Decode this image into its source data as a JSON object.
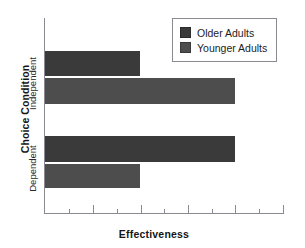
{
  "top_remnant": "",
  "chart_data": {
    "type": "bar",
    "orientation": "horizontal",
    "title": "",
    "xlabel": "Effectiveness",
    "ylabel": "Choice Condition",
    "categories": [
      "Independent",
      "Dependent"
    ],
    "grid": false,
    "xlim": [
      0,
      10
    ],
    "x_tick_labels": [],
    "x_ticks_major": [
      1,
      2,
      3,
      4,
      5,
      6,
      7,
      8
    ],
    "x_ticks_minor": [
      0.5,
      1.5,
      2.5,
      3.5,
      4.5,
      5.5,
      6.5,
      7.5
    ],
    "legend_position": "top-right",
    "series": [
      {
        "name": "Older Adults",
        "color": "#3a3a3a",
        "values": [
          4.0,
          8.0
        ]
      },
      {
        "name": "Younger Adults",
        "color": "#4d4d4d",
        "values": [
          8.0,
          4.0
        ]
      }
    ]
  },
  "legend": {
    "items": [
      {
        "label": "Older Adults",
        "color": "#3a3a3a"
      },
      {
        "label": "Younger Adults",
        "color": "#4d4d4d"
      }
    ]
  },
  "geometry": {
    "plot_left": 45,
    "plot_right": 284,
    "axis_top": 18,
    "axis_bottom": 213,
    "bars": [
      {
        "series": "Older Adults",
        "category": "Independent",
        "top": 51,
        "height": 25,
        "width": 95,
        "color": "#3a3a3a"
      },
      {
        "series": "Younger Adults",
        "category": "Independent",
        "top": 78,
        "height": 26,
        "width": 190,
        "color": "#4d4d4d"
      },
      {
        "series": "Older Adults",
        "category": "Dependent",
        "top": 136,
        "height": 26,
        "width": 190,
        "color": "#3a3a3a"
      },
      {
        "series": "Younger Adults",
        "category": "Dependent",
        "top": 164,
        "height": 24,
        "width": 95,
        "color": "#4d4d4d"
      }
    ],
    "ticks": [
      {
        "x": 69,
        "kind": "minor"
      },
      {
        "x": 93,
        "kind": "major"
      },
      {
        "x": 117,
        "kind": "minor"
      },
      {
        "x": 141,
        "kind": "major"
      },
      {
        "x": 164,
        "kind": "minor"
      },
      {
        "x": 188,
        "kind": "major"
      },
      {
        "x": 212,
        "kind": "minor"
      },
      {
        "x": 235,
        "kind": "major"
      },
      {
        "x": 259,
        "kind": "minor"
      },
      {
        "x": 283,
        "kind": "major"
      }
    ]
  }
}
